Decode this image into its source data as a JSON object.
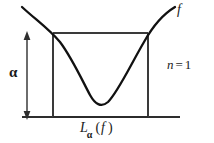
{
  "figure": {
    "type": "math-diagram",
    "background_color": "#ffffff",
    "ink_color": "#1a1a1a",
    "curve_color": "#111111",
    "rule_color": "#3a3a3a",
    "labels": {
      "function": "f",
      "alpha": "α",
      "dimension_variable": "n",
      "dimension_equals": "=",
      "dimension_value": "1",
      "levelset_L": "L",
      "levelset_subscript": "α",
      "levelset_open_paren": "(",
      "levelset_arg": "f",
      "levelset_close_paren": ")"
    },
    "geometry": {
      "baseline": {
        "x1": 22,
        "y": 117,
        "x2": 180
      },
      "rectangle": {
        "x": 53,
        "y": 33,
        "width": 95,
        "height": 84
      },
      "alpha_arrow": {
        "x": 27,
        "y_top": 34,
        "y_bottom": 117
      },
      "curve_path": "M 22 7 C 36 20, 48 28, 60 42 C 72 58, 82 80, 90 95 C 95 104, 101 108, 108 102 C 118 92, 130 66, 144 42 C 154 24, 165 13, 175 7",
      "curve_stroke_width": 2.3,
      "rule_stroke_width": 1.1
    }
  }
}
